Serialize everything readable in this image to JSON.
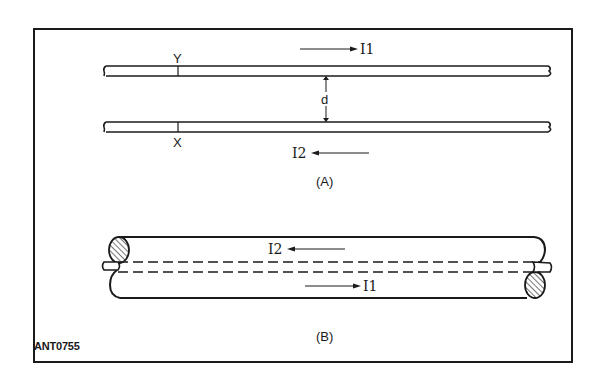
{
  "figure_code": "ANT0755",
  "panel_a": {
    "label": "(A)",
    "current_top": "I1",
    "current_bottom": "I2",
    "spacing_label": "d",
    "point_top": "Y",
    "point_bottom": "X"
  },
  "panel_b": {
    "label": "(B)",
    "current_upper": "I2",
    "current_lower": "I1"
  },
  "colors": {
    "line": "#1a1a1a",
    "background": "#ffffff"
  }
}
